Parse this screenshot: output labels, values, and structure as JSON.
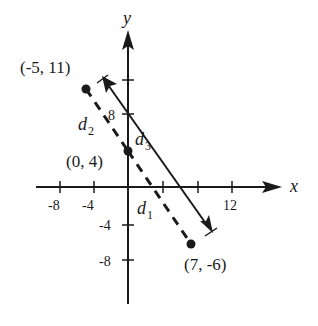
{
  "axes": {
    "x_label": "x",
    "y_label": "y",
    "x_ticks": [
      "-8",
      "-4",
      "12"
    ],
    "y_ticks": [
      "8",
      "-4",
      "-8"
    ]
  },
  "points": [
    {
      "label": "(-5, 11)",
      "x": -5,
      "y": 11
    },
    {
      "label": "(0, 4)",
      "x": 0,
      "y": 4
    },
    {
      "label": "(7, -6)",
      "x": 7,
      "y": -6
    }
  ],
  "segments": {
    "d1": {
      "label": "d",
      "sub": "1"
    },
    "d2": {
      "label": "d",
      "sub": "2"
    },
    "d3": {
      "label": "d",
      "sub": "3"
    }
  },
  "colors": {
    "ink": "#1a1a1a",
    "background": "#ffffff"
  }
}
